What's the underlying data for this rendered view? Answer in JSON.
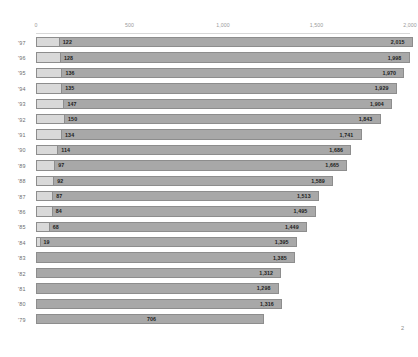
{
  "chart_data": {
    "type": "bar",
    "title": "",
    "subtitle": "",
    "xlabel": "",
    "ylabel": "",
    "orientation": "horizontal",
    "stacked": true,
    "grid": false,
    "legend_position": "none",
    "xlim": [
      0,
      2000
    ],
    "xticks": [
      0,
      500,
      1000,
      1500,
      2000
    ],
    "xtick_labels": [
      "0",
      "500",
      "1,000",
      "1,500",
      "2,000"
    ],
    "categories": [
      "'97",
      "'96",
      "'95",
      "'94",
      "'93",
      "'92",
      "'91",
      "'90",
      "'89",
      "'88",
      "'87",
      "'86",
      "'85",
      "'84",
      "'83",
      "'82",
      "'81",
      "'80",
      "'79"
    ],
    "series": [
      {
        "name": "first-segment",
        "color": "#d9d9d9",
        "values": [
          122,
          128,
          136,
          135,
          147,
          150,
          134,
          114,
          97,
          92,
          87,
          84,
          68,
          19,
          0,
          0,
          0,
          0,
          0
        ]
      },
      {
        "name": "second-segment",
        "color": "#a8a8a8",
        "values": [
          1893,
          1870,
          1834,
          1794,
          1757,
          1693,
          1607,
          1572,
          1568,
          1497,
          1426,
          1411,
          1381,
          1376,
          1385,
          1312,
          1298,
          1316,
          706
        ]
      }
    ],
    "totals": [
      2015,
      1998,
      1970,
      1929,
      1904,
      1843,
      1741,
      1686,
      1665,
      1589,
      1513,
      1495,
      1449,
      1395,
      1385,
      1312,
      1298,
      1316,
      1220
    ],
    "segment_labels": [
      "122",
      "128",
      "136",
      "135",
      "147",
      "150",
      "134",
      "114",
      "97",
      "92",
      "87",
      "84",
      "68",
      "19",
      "",
      "",
      "",
      "",
      ""
    ],
    "total_labels": [
      "2,015",
      "1,998",
      "1,970",
      "1,929",
      "1,904",
      "1,843",
      "1,741",
      "1,686",
      "1,665",
      "1,589",
      "1,513",
      "1,495",
      "1,449",
      "1,395",
      "1,385",
      "1,312",
      "1,298",
      "1,316",
      "1,220"
    ],
    "bottom_row_inner_label": "706",
    "bottom_row_inner_value": 706
  },
  "footer": {
    "page_number": "2"
  },
  "colors": {
    "segment_light": "#d9d9d9",
    "segment_dark": "#a8a8a8",
    "bar_border": "#8d8d8d",
    "axis_text": "#9a9a9a",
    "year_text": "#6d6d6d",
    "value_text": "#1d1d1d",
    "background": "#ffffff"
  }
}
